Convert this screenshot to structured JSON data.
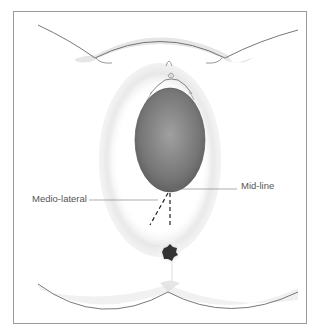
{
  "diagram": {
    "type": "anatomical illustration",
    "labels": {
      "medio_lateral": "Medio-lateral",
      "mid_line": "Mid-line"
    },
    "colors": {
      "frame": "#9a9a9a",
      "outline": "#555555",
      "skin_shade": "#e4e4e4",
      "head_dark": "#5e5e5e",
      "head_light": "#9a9a9a",
      "incision": "#222222",
      "label_text": "#555555"
    }
  }
}
